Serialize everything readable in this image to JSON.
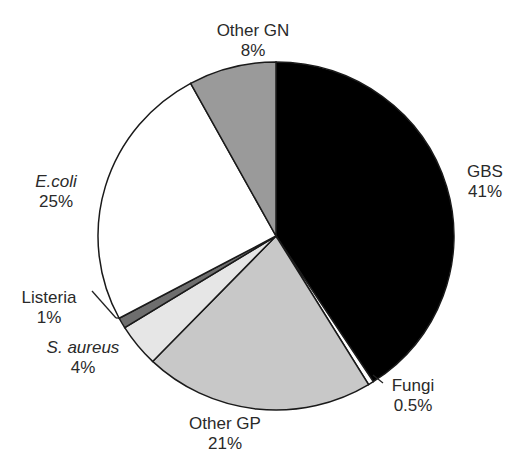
{
  "chart_data": {
    "type": "pie",
    "title": "",
    "start_angle_deg": 0,
    "direction": "clockwise",
    "slices": [
      {
        "label": "GBS",
        "value": 41,
        "value_label": "41%",
        "color": "#000000"
      },
      {
        "label": "Fungi",
        "value": 0.5,
        "value_label": "0.5%",
        "color": "#ffffff"
      },
      {
        "label": "Other GP",
        "value": 21,
        "value_label": "21%",
        "color": "#c8c8c8"
      },
      {
        "label": "S. aureus",
        "value": 4,
        "value_label": "4%",
        "color": "#e6e6e6"
      },
      {
        "label": "Listeria",
        "value": 1,
        "value_label": "1%",
        "color": "#6e6e6e"
      },
      {
        "label": "E.coli",
        "value": 25,
        "value_label": "25%",
        "color": "#ffffff"
      },
      {
        "label": "Other GN",
        "value": 8,
        "value_label": "8%",
        "color": "#9a9a9a"
      }
    ]
  },
  "labels": {
    "gbs": {
      "name": "GBS",
      "pct": "41%"
    },
    "fungi": {
      "name": "Fungi",
      "pct": "0.5%"
    },
    "other_gp": {
      "name": "Other GP",
      "pct": "21%"
    },
    "s_aureus": {
      "name": "S. aureus",
      "pct": "4%"
    },
    "listeria": {
      "name": "Listeria",
      "pct": "1%"
    },
    "e_coli": {
      "name": "E.coli",
      "pct": "25%"
    },
    "other_gn": {
      "name": "Other GN",
      "pct": "8%"
    }
  }
}
